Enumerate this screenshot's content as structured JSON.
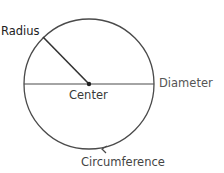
{
  "diagram": {
    "labels": {
      "radius": "Radius",
      "center": "Center",
      "diameter": "Diameter",
      "circumference": "Circumference"
    },
    "geometry": {
      "center_x": 89,
      "center_y": 84,
      "radius": 65
    },
    "colors": {
      "stroke": "#4a4a4a",
      "text": "#3a3a3a"
    }
  }
}
